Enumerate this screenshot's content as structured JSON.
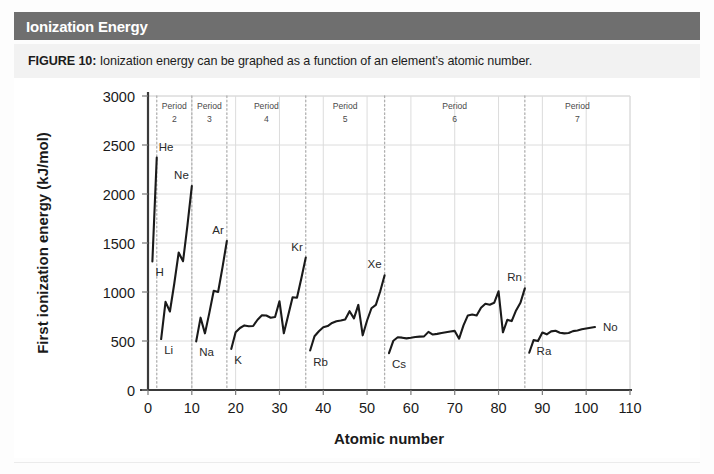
{
  "header": {
    "title": "Ionization Energy",
    "bar_color": "#6f6f6f",
    "text_color": "#ffffff"
  },
  "caption": {
    "figure_label": "FIGURE 10:",
    "text": " Ionization energy can be graphed as a function of an element’s atomic number."
  },
  "chart_data": {
    "type": "line",
    "title": "Ionization Energy",
    "xlabel": "Atomic number",
    "ylabel": "First ionization energy (kJ/mol)",
    "xlim": [
      0,
      110
    ],
    "ylim": [
      0,
      3000
    ],
    "xticks": [
      0,
      10,
      20,
      30,
      40,
      50,
      60,
      70,
      80,
      90,
      100,
      110
    ],
    "yticks": [
      0,
      500,
      1000,
      1500,
      2000,
      2500,
      3000
    ],
    "grid": true,
    "legend": "none",
    "line_color": "#1a1a1a",
    "grid_color": "#dcdcdc",
    "divider_color": "#b0b0b0",
    "series": [
      {
        "name": "First ionization energy",
        "x": [
          1,
          2,
          3,
          4,
          5,
          6,
          7,
          8,
          9,
          10,
          11,
          12,
          13,
          14,
          15,
          16,
          17,
          18,
          19,
          20,
          21,
          22,
          23,
          24,
          25,
          26,
          27,
          28,
          29,
          30,
          31,
          32,
          33,
          34,
          35,
          36,
          37,
          38,
          39,
          40,
          41,
          42,
          43,
          44,
          45,
          46,
          47,
          48,
          49,
          50,
          51,
          52,
          53,
          54,
          55,
          56,
          57,
          58,
          59,
          60,
          61,
          62,
          63,
          64,
          65,
          66,
          67,
          68,
          69,
          70,
          71,
          72,
          73,
          74,
          75,
          76,
          77,
          78,
          79,
          80,
          81,
          82,
          83,
          84,
          85,
          86,
          87,
          88,
          89,
          90,
          91,
          92,
          93,
          94,
          95,
          96,
          97,
          98,
          99,
          100,
          101,
          102
        ],
        "values": [
          1312,
          2372,
          520,
          899,
          801,
          1087,
          1402,
          1314,
          1681,
          2081,
          496,
          738,
          578,
          787,
          1012,
          1000,
          1251,
          1521,
          419,
          590,
          633,
          659,
          651,
          653,
          717,
          762,
          760,
          737,
          745,
          906,
          579,
          762,
          947,
          941,
          1140,
          1351,
          403,
          549,
          600,
          640,
          652,
          684,
          702,
          710,
          720,
          804,
          731,
          868,
          558,
          709,
          834,
          869,
          1008,
          1170,
          376,
          503,
          538,
          534,
          527,
          533,
          540,
          545,
          547,
          593,
          566,
          573,
          581,
          589,
          597,
          603,
          524,
          659,
          761,
          770,
          760,
          840,
          880,
          870,
          890,
          1007,
          589,
          716,
          703,
          812,
          890,
          1037,
          380,
          509,
          499,
          587,
          568,
          598,
          605,
          585,
          578,
          581,
          601,
          608,
          619,
          627,
          635,
          642
        ]
      }
    ],
    "element_labels": [
      {
        "symbol": "H",
        "z": 1,
        "energy": 1312,
        "anchor": "below-right"
      },
      {
        "symbol": "He",
        "z": 2,
        "energy": 2372,
        "anchor": "above-right"
      },
      {
        "symbol": "Li",
        "z": 3,
        "energy": 520,
        "anchor": "below-right"
      },
      {
        "symbol": "Ne",
        "z": 10,
        "energy": 2081,
        "anchor": "above-left"
      },
      {
        "symbol": "Na",
        "z": 11,
        "energy": 496,
        "anchor": "below-right"
      },
      {
        "symbol": "Ar",
        "z": 18,
        "energy": 1521,
        "anchor": "above-left"
      },
      {
        "symbol": "K",
        "z": 19,
        "energy": 419,
        "anchor": "below-right"
      },
      {
        "symbol": "Kr",
        "z": 36,
        "energy": 1351,
        "anchor": "above-left"
      },
      {
        "symbol": "Rb",
        "z": 37,
        "energy": 403,
        "anchor": "below-right"
      },
      {
        "symbol": "Xe",
        "z": 54,
        "energy": 1170,
        "anchor": "above-left"
      },
      {
        "symbol": "Cs",
        "z": 55,
        "energy": 376,
        "anchor": "below-right"
      },
      {
        "symbol": "Rn",
        "z": 86,
        "energy": 1037,
        "anchor": "above-left"
      },
      {
        "symbol": "Ra",
        "z": 88,
        "energy": 509,
        "anchor": "below-right"
      },
      {
        "symbol": "No",
        "z": 102,
        "energy": 642,
        "anchor": "right"
      }
    ],
    "period_dividers": [
      2,
      10,
      18,
      36,
      54,
      86
    ],
    "period_bands": [
      {
        "label": "Period",
        "number": "2",
        "start": 2,
        "end": 10
      },
      {
        "label": "Period",
        "number": "3",
        "start": 10,
        "end": 18
      },
      {
        "label": "Period",
        "number": "4",
        "start": 18,
        "end": 36
      },
      {
        "label": "Period",
        "number": "5",
        "start": 36,
        "end": 54
      },
      {
        "label": "Period",
        "number": "6",
        "start": 54,
        "end": 86
      },
      {
        "label": "Period",
        "number": "7",
        "start": 86,
        "end": 110
      }
    ]
  }
}
